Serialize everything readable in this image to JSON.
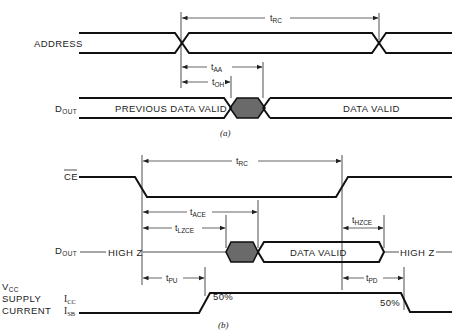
{
  "diagram": {
    "part_a": {
      "caption": "(a)",
      "signals": {
        "address": "ADDRESS",
        "dout_main": "D",
        "dout_sub": "OUT"
      },
      "regions": {
        "previous_data_valid": "PREVIOUS DATA VALID",
        "data_valid": "DATA VALID"
      },
      "timings": {
        "trc_main": "t",
        "trc_sub": "RC",
        "taa_main": "t",
        "taa_sub": "AA",
        "toh_main": "t",
        "toh_sub": "OH"
      }
    },
    "part_b": {
      "caption": "(b)",
      "signals": {
        "ce": "CE",
        "dout_main": "D",
        "dout_sub": "OUT",
        "vcc_main": "V",
        "vcc_sub": "CC",
        "supply": "SUPPLY",
        "current": "CURRENT",
        "icc_main": "I",
        "icc_sub": "CC",
        "isb_main": "I",
        "isb_sub": "SB"
      },
      "regions": {
        "high_z_left": "HIGH Z",
        "data_valid": "DATA VALID",
        "high_z_right": "HIGH Z",
        "pct_rise": "50%",
        "pct_fall": "50%"
      },
      "timings": {
        "trc_main": "t",
        "trc_sub": "RC",
        "tace_main": "t",
        "tace_sub": "ACE",
        "tlzce_main": "t",
        "tlzce_sub": "LZCE",
        "thzce_main": "t",
        "thzce_sub": "HZCE",
        "tpu_main": "t",
        "tpu_sub": "PU",
        "tpd_main": "t",
        "tpd_sub": "PD"
      }
    }
  }
}
